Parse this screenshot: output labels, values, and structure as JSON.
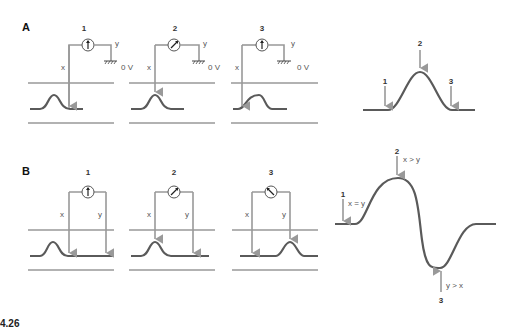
{
  "sections": {
    "A": {
      "label": "A",
      "panels": [
        {
          "number": "1",
          "x_label": "x",
          "y_label": "y",
          "ground_label": "0 V",
          "meter": "up"
        },
        {
          "number": "2",
          "x_label": "x",
          "y_label": "y",
          "ground_label": "0 V",
          "meter": "right"
        },
        {
          "number": "3",
          "x_label": "x",
          "y_label": "y",
          "ground_label": "0 V",
          "meter": "up"
        }
      ],
      "waveform": {
        "markers": [
          "1",
          "2",
          "3"
        ]
      }
    },
    "B": {
      "label": "B",
      "panels": [
        {
          "number": "1",
          "x_label": "x",
          "y_label": "y",
          "meter": "up"
        },
        {
          "number": "2",
          "x_label": "x",
          "y_label": "y",
          "meter": "right"
        },
        {
          "number": "3",
          "x_label": "x",
          "y_label": "y",
          "meter": "left"
        }
      ],
      "waveform": {
        "markers": [
          {
            "number": "1",
            "note": "x = y"
          },
          {
            "number": "2",
            "note": "x > y"
          },
          {
            "number": "3",
            "note": "y > x"
          }
        ]
      }
    }
  },
  "caption": "4.26",
  "colors": {
    "line": "#555555",
    "arrow": "#999999",
    "wave": "#5a5a5a"
  }
}
